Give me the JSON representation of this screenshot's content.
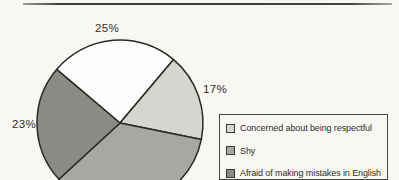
{
  "chart_data": {
    "type": "pie",
    "legend_position": "right",
    "start_angle_deg": -139.8,
    "clockwise": true,
    "slices": [
      {
        "legend_label": "",
        "pct_label": "25%",
        "value": 25,
        "color": "#fcfcfa"
      },
      {
        "legend_label": "Concerned about being respectful",
        "pct_label": "17%",
        "value": 17,
        "color": "#d6d5d1"
      },
      {
        "legend_label": "Shy",
        "pct_label": "",
        "value": 35,
        "color": "#a8a7a2"
      },
      {
        "legend_label": "Afraid of making mistakes in English",
        "pct_label": "23%",
        "value": 23,
        "color": "#8b8a85"
      }
    ]
  }
}
